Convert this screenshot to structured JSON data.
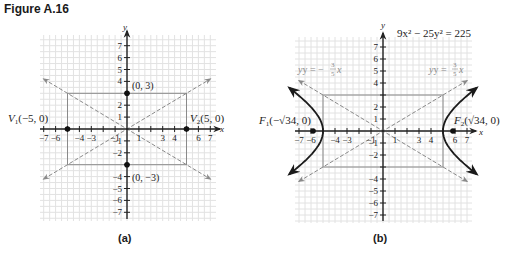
{
  "figure_title": "Figure A.16",
  "captions": {
    "a": "(a)",
    "b": "(b)"
  },
  "chart_data": [
    {
      "type": "line",
      "panel": "a",
      "title": "",
      "xlabel": "x",
      "ylabel": "y",
      "xlim": [
        -7,
        7
      ],
      "ylim": [
        -7,
        7
      ],
      "grid": true,
      "x_ticks": [
        -7,
        -6,
        -4,
        -3,
        -1,
        1,
        3,
        4,
        6,
        7
      ],
      "y_ticks": [
        7,
        6,
        5,
        4,
        2,
        1,
        -1,
        -2,
        -4,
        -5,
        -6,
        -7
      ],
      "points": [
        {
          "label": "V1(-5, 0)",
          "x": -5,
          "y": 0
        },
        {
          "label": "V2(5, 0)",
          "x": 5,
          "y": 0
        },
        {
          "label": "(0, 3)",
          "x": 0,
          "y": 3
        },
        {
          "label": "(0, -3)",
          "x": 0,
          "y": -3
        }
      ],
      "rectangle": {
        "x": [
          -5,
          5
        ],
        "y": [
          -3,
          3
        ]
      },
      "asymptotes": [
        {
          "name": "y = 3/5 x",
          "slope": 0.6,
          "style": "dashed"
        },
        {
          "name": "y = -3/5 x",
          "slope": -0.6,
          "style": "dashed"
        }
      ]
    },
    {
      "type": "line",
      "panel": "b",
      "title": "9x^2 - 25y^2 = 225",
      "xlabel": "x",
      "ylabel": "y",
      "xlim": [
        -7,
        7
      ],
      "ylim": [
        -7,
        7
      ],
      "grid": true,
      "x_ticks": [
        -7,
        -6,
        -4,
        -3,
        -1,
        1,
        3,
        4,
        6,
        7
      ],
      "y_ticks": [
        7,
        6,
        5,
        4,
        2,
        1,
        -1,
        -2,
        -4,
        -5,
        -6,
        -7
      ],
      "points": [
        {
          "label": "F1(-√34, 0)",
          "x": -5.83,
          "y": 0
        },
        {
          "label": "F2(√34, 0)",
          "x": 5.83,
          "y": 0
        }
      ],
      "rectangle": {
        "x": [
          -5,
          5
        ],
        "y": [
          -3,
          3
        ]
      },
      "asymptotes": [
        {
          "name": "y = 3/5 x",
          "slope": 0.6,
          "style": "dashed"
        },
        {
          "name": "y = -3/5 x",
          "slope": -0.6,
          "style": "dashed"
        }
      ],
      "series": [
        {
          "name": "hyperbola right branch",
          "equation": "x = 5*sqrt(1 + y^2/9)",
          "y_range": [
            -3.6,
            3.6
          ]
        },
        {
          "name": "hyperbola left branch",
          "equation": "x = -5*sqrt(1 + y^2/9)",
          "y_range": [
            -3.6,
            3.6
          ]
        }
      ]
    }
  ],
  "labels": {
    "a": {
      "y_axis": "y",
      "x_axis": "x",
      "p03": "(0, 3)",
      "p0m3": "(0, −3)",
      "v1": "V",
      "v1_sub": "1",
      "v1_rest": "(−5, 0)",
      "v2": "V",
      "v2_sub": "2",
      "v2_rest": "(5, 0)"
    },
    "b": {
      "y_axis": "y",
      "x_axis": "x",
      "equation": "9x² − 25y² = 225",
      "asym_neg": "y = −",
      "asym_pos": "y = ",
      "frac_num": "3",
      "frac_den": "5",
      "asym_x": "x",
      "f1": "F",
      "f1_sub": "1",
      "f1_rest": "(−√34, 0)",
      "f2": "F",
      "f2_sub": "2",
      "f2_rest": "(√34, 0)"
    },
    "x_tick_labels": [
      "−7",
      "−6",
      "−4",
      "−3",
      "−1",
      "1",
      "3",
      "4",
      "6",
      "7"
    ],
    "y_tick_labels_pos": [
      "7",
      "6",
      "5",
      "4",
      "2",
      "1"
    ],
    "y_tick_labels_neg": [
      "−1",
      "−2",
      "−4",
      "−5",
      "−6",
      "−7"
    ]
  }
}
